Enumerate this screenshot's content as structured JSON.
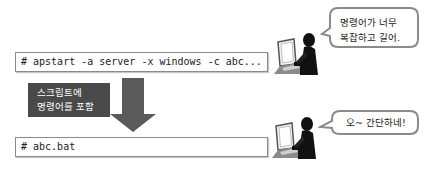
{
  "before": {
    "command": "# apstart -a server -x windows -c abc...",
    "speech": {
      "line1": "명령어가 너무",
      "line2": "복잡하고 길어."
    }
  },
  "transition": {
    "label_line1": "스크립트에",
    "label_line2": "명령어를 포함",
    "icon": "down-arrow-icon"
  },
  "after": {
    "command": "# abc.bat",
    "speech": {
      "line1": "오~ 간단하네!"
    }
  },
  "colors": {
    "label_bg": "#4a4a4a",
    "arrow": "#5a5a5a",
    "figure": "#111111",
    "bubble_border": "#8a8a8a"
  }
}
